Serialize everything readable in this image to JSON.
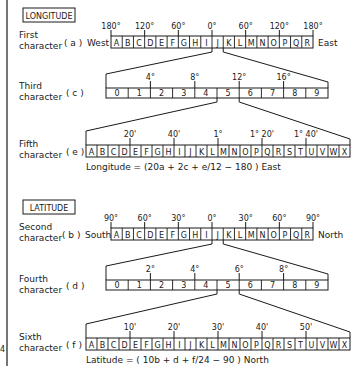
{
  "longitude": {
    "section_title": "LONGITUDE",
    "rows": [
      {
        "id": "a",
        "label_line1": "First",
        "label_line2": "character",
        "var": "( a )",
        "left_dir": "West",
        "right_dir": "East",
        "cells": [
          "A",
          "B",
          "C",
          "D",
          "E",
          "F",
          "G",
          "H",
          "I",
          "J",
          "K",
          "L",
          "M",
          "N",
          "O",
          "P",
          "Q",
          "R"
        ],
        "ticks": [
          {
            "after_cells": 0,
            "label": "180°"
          },
          {
            "after_cells": 3,
            "label": "120°"
          },
          {
            "after_cells": 6,
            "label": "60°"
          },
          {
            "after_cells": 9,
            "label": "0°"
          },
          {
            "after_cells": 12,
            "label": "60°"
          },
          {
            "after_cells": 15,
            "label": "120°"
          },
          {
            "after_cells": 18,
            "label": "180°"
          }
        ]
      },
      {
        "id": "c",
        "label_line1": "Third",
        "label_line2": "character",
        "var": "( c )",
        "cells": [
          "0",
          "1",
          "2",
          "3",
          "4",
          "5",
          "6",
          "7",
          "8",
          "9"
        ],
        "ticks": [
          {
            "after_cells": 2,
            "label": "4°"
          },
          {
            "after_cells": 4,
            "label": "8°"
          },
          {
            "after_cells": 6,
            "label": "12°"
          },
          {
            "after_cells": 8,
            "label": "16°"
          }
        ],
        "expands_cell_of_previous": 9
      },
      {
        "id": "e",
        "label_line1": "Fifth",
        "label_line2": "character",
        "var": "( e )",
        "cells": [
          "A",
          "B",
          "C",
          "D",
          "E",
          "F",
          "G",
          "H",
          "I",
          "J",
          "K",
          "L",
          "M",
          "N",
          "O",
          "P",
          "Q",
          "R",
          "S",
          "T",
          "U",
          "V",
          "W",
          "X"
        ],
        "ticks": [
          {
            "after_cells": 4,
            "label": "20'"
          },
          {
            "after_cells": 8,
            "label": "40'"
          },
          {
            "after_cells": 12,
            "label": "1°"
          },
          {
            "after_cells": 16,
            "label": "1° 20'"
          },
          {
            "after_cells": 20,
            "label": "1° 40'"
          }
        ],
        "expands_cell_of_previous": 5
      }
    ],
    "formula": "Longitude = (20a + 2c + e/12 − 180 )  East"
  },
  "latitude": {
    "section_title": "LATITUDE",
    "rows": [
      {
        "id": "b",
        "label_line1": "Second",
        "label_line2": "character",
        "var": "( b )",
        "left_dir": "South",
        "right_dir": "North",
        "cells": [
          "A",
          "B",
          "C",
          "D",
          "E",
          "F",
          "G",
          "H",
          "I",
          "J",
          "K",
          "L",
          "M",
          "N",
          "O",
          "P",
          "Q",
          "R"
        ],
        "ticks": [
          {
            "after_cells": 0,
            "label": "90°"
          },
          {
            "after_cells": 3,
            "label": "60°"
          },
          {
            "after_cells": 6,
            "label": "30°"
          },
          {
            "after_cells": 9,
            "label": "0°"
          },
          {
            "after_cells": 12,
            "label": "30°"
          },
          {
            "after_cells": 15,
            "label": "60°"
          },
          {
            "after_cells": 18,
            "label": "90°"
          }
        ]
      },
      {
        "id": "d",
        "label_line1": "Fourth",
        "label_line2": "character",
        "var": "( d )",
        "cells": [
          "0",
          "1",
          "2",
          "3",
          "4",
          "5",
          "6",
          "7",
          "8",
          "9"
        ],
        "ticks": [
          {
            "after_cells": 2,
            "label": "2°"
          },
          {
            "after_cells": 4,
            "label": "4°"
          },
          {
            "after_cells": 6,
            "label": "6°"
          },
          {
            "after_cells": 8,
            "label": "8°"
          }
        ],
        "expands_cell_of_previous": 9
      },
      {
        "id": "f",
        "label_line1": "Sixth",
        "label_line2": "character",
        "var": "( f )",
        "cells": [
          "A",
          "B",
          "C",
          "D",
          "E",
          "F",
          "G",
          "H",
          "I",
          "J",
          "K",
          "L",
          "M",
          "N",
          "O",
          "P",
          "Q",
          "R",
          "S",
          "T",
          "U",
          "V",
          "W",
          "X"
        ],
        "ticks": [
          {
            "after_cells": 4,
            "label": "10'"
          },
          {
            "after_cells": 8,
            "label": "20'"
          },
          {
            "after_cells": 12,
            "label": "30'"
          },
          {
            "after_cells": 16,
            "label": "40'"
          },
          {
            "after_cells": 20,
            "label": "50'"
          }
        ],
        "expands_cell_of_previous": 5
      }
    ],
    "formula": "Latitude = ( 10b + d + f/24 − 90 )  North"
  },
  "margin_mark": "4"
}
